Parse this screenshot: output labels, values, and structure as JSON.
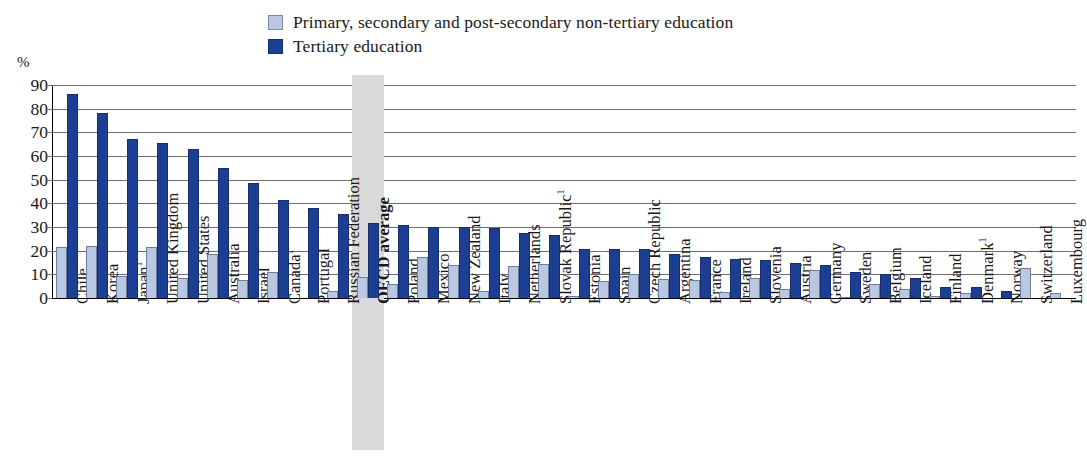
{
  "legend": {
    "items": [
      {
        "label": "Primary, secondary and post-secondary non-tertiary education",
        "color": "#b9c7e1",
        "key": "primary"
      },
      {
        "label": "Tertiary education",
        "color": "#1c3f94",
        "key": "tertiary"
      }
    ]
  },
  "axis": {
    "unit": "%",
    "yticks": [
      "0",
      "10",
      "20",
      "30",
      "40",
      "50",
      "60",
      "70",
      "80",
      "90"
    ]
  },
  "highlight": {
    "category": "OECD average",
    "color": "#d9d9d9"
  },
  "chart_data": {
    "type": "bar",
    "title": "",
    "xlabel": "",
    "ylabel": "%",
    "ylim": [
      0,
      90
    ],
    "ytick_step": 10,
    "grid": true,
    "legend_position": "top",
    "highlighted_category": "OECD average",
    "categories": [
      "Chile",
      "Korea",
      "Japan¹",
      "United Kingdom",
      "United States",
      "Australia",
      "Israel",
      "Canada¹",
      "Portugal",
      "Russian Federation",
      "OECD average",
      "Poland",
      "Mexico",
      "New Zealand",
      "Italy",
      "Netherlands",
      "Slovak Republic¹",
      "Estonia",
      "Spain",
      "Czech Republic",
      "Argentina",
      "France",
      "Ireland",
      "Slovenia",
      "Austria",
      "Germany",
      "Sweden",
      "Belgium",
      "Iceland",
      "Finland",
      "Denmark¹",
      "Norway",
      "Switzerland",
      "Luxembourg"
    ],
    "series": [
      {
        "name": "Primary, secondary and post-secondary non-tertiary education",
        "color": "#b9c7e1",
        "values": [
          21.5,
          22.0,
          9.5,
          21.5,
          8.5,
          18.5,
          7.5,
          11.0,
          0.0,
          3.0,
          9.0,
          6.0,
          17.5,
          14.0,
          3.0,
          13.5,
          14.5,
          1.0,
          7.0,
          10.0,
          8.0,
          7.5,
          2.5,
          8.5,
          4.0,
          12.0,
          0.5,
          6.0,
          4.0,
          1.0,
          2.0,
          0.0,
          12.5,
          2.0
        ]
      },
      {
        "name": "Tertiary education",
        "color": "#1c3f94",
        "values": [
          86.0,
          78.0,
          67.0,
          65.5,
          63.0,
          55.0,
          48.5,
          41.5,
          38.0,
          35.5,
          31.5,
          31.0,
          30.0,
          30.0,
          29.5,
          27.5,
          26.5,
          20.5,
          20.5,
          20.5,
          18.5,
          17.5,
          16.5,
          16.0,
          15.0,
          14.0,
          11.0,
          10.0,
          8.5,
          4.5,
          4.5,
          3.0,
          0.0,
          0.0
        ]
      }
    ]
  }
}
